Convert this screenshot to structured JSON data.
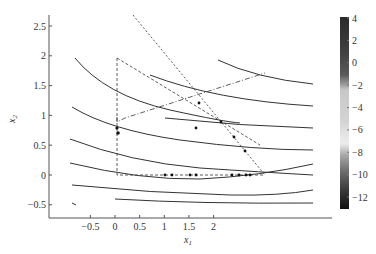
{
  "chart_data": {
    "type": "contour",
    "title": "",
    "xlabel": "x1",
    "ylabel": "x2",
    "xlim": [
      -0.65,
      2.35
    ],
    "ylim": [
      -0.72,
      2.65
    ],
    "x_ticks": [
      -0.5,
      0,
      0.5,
      1,
      1.5,
      2
    ],
    "x_tick_labels": [
      "-0.5",
      "0",
      "0.5",
      "1",
      "1.5",
      "2"
    ],
    "y_ticks": [
      -0.5,
      0,
      0.5,
      1,
      1.5,
      2,
      2.5
    ],
    "y_tick_labels": [
      "-0.5",
      "0",
      "0.5",
      "1",
      "1.5",
      "2",
      "2.5"
    ],
    "grid": false,
    "colorbar": {
      "position": "right",
      "range": [
        -13,
        4
      ],
      "ticks": [
        4,
        2,
        0,
        -2,
        -4,
        -6,
        -8,
        -10,
        -12
      ],
      "tick_labels": [
        "4",
        "2",
        "0",
        "-2",
        "-4",
        "-6",
        "-8",
        "-10",
        "-12"
      ]
    },
    "contour_lines": [
      {
        "points": [
          [
            -0.25,
            1.98
          ],
          [
            0.0,
            1.55
          ],
          [
            0.5,
            1.2
          ],
          [
            1.0,
            1.0
          ],
          [
            1.5,
            1.83
          ]
        ]
      },
      {
        "points": [
          [
            -0.3,
            1.17
          ],
          [
            0.0,
            0.95
          ],
          [
            0.5,
            0.75
          ],
          [
            1.0,
            1.65
          ],
          [
            2.0,
            1.55
          ]
        ]
      },
      {
        "points": [
          [
            -0.45,
            0.65
          ],
          [
            0.0,
            0.45
          ],
          [
            0.5,
            0.3
          ],
          [
            1.0,
            1.2
          ],
          [
            2.0,
            1.15
          ]
        ]
      },
      {
        "points": [
          [
            -0.45,
            0.24
          ],
          [
            0.0,
            0.05
          ],
          [
            0.5,
            0.9
          ],
          [
            2.0,
            0.8
          ]
        ]
      },
      {
        "points": [
          [
            -0.45,
            -0.13
          ],
          [
            0.5,
            0.55
          ],
          [
            2.0,
            0.45
          ]
        ]
      },
      {
        "points": [
          [
            0.5,
            0.25
          ],
          [
            2.0,
            0.2
          ]
        ]
      },
      {
        "points": [
          [
            0.5,
            0.0
          ],
          [
            2.0,
            -0.05
          ]
        ]
      },
      {
        "points": [
          [
            0.5,
            -0.25
          ],
          [
            2.0,
            -0.3
          ]
        ]
      }
    ],
    "trajectories": [
      {
        "style": "dashed",
        "points": [
          [
            0.0,
            2.0
          ],
          [
            0.0,
            0.0
          ],
          [
            1.5,
            0.0
          ]
        ],
        "markers": [
          [
            0.0,
            0.8
          ],
          [
            0.02,
            0.72
          ],
          [
            0.5,
            0.0
          ],
          [
            0.55,
            0.0
          ],
          [
            0.8,
            0.0
          ],
          [
            0.85,
            0.0
          ],
          [
            1.2,
            0.0
          ],
          [
            1.28,
            0.0
          ],
          [
            1.35,
            0.0
          ],
          [
            1.4,
            0.0
          ]
        ]
      },
      {
        "style": "dashed",
        "points": [
          [
            0.0,
            2.0
          ],
          [
            1.45,
            0.55
          ]
        ],
        "markers": [
          [
            0.8,
            1.2
          ],
          [
            1.1,
            0.9
          ],
          [
            1.3,
            0.7
          ]
        ]
      },
      {
        "style": "dashed",
        "points": [
          [
            0.2,
            2.65
          ],
          [
            1.5,
            0.0
          ]
        ],
        "markers": [
          [
            0.95,
            1.1
          ],
          [
            1.25,
            0.55
          ]
        ]
      },
      {
        "style": "dashdot",
        "points": [
          [
            0.0,
            1.0
          ],
          [
            0.0,
            0.85
          ],
          [
            1.5,
            1.78
          ]
        ],
        "markers": []
      }
    ]
  }
}
